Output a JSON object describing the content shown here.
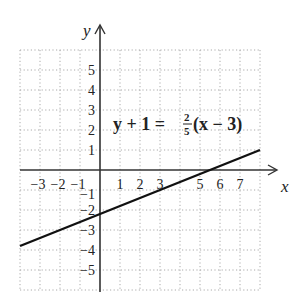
{
  "chart_data": {
    "type": "line",
    "title": "",
    "xlabel": "x",
    "ylabel": "y",
    "xlim": [
      -4,
      8
    ],
    "ylim": [
      -6,
      6
    ],
    "grid": true,
    "grid_style": "dotted",
    "x_ticks": [
      "-3",
      "-2",
      "-1",
      "1",
      "2",
      "3",
      "5",
      "6",
      "7"
    ],
    "y_ticks": [
      "5",
      "4",
      "3",
      "2",
      "1",
      "-1",
      "-2",
      "-3",
      "-4",
      "-5"
    ],
    "annotation": "y + 1 = 2/5(x − 3)",
    "equation": {
      "lhs": "y + 1 =",
      "num": "2",
      "den": "5",
      "rhs": "(x − 3)"
    },
    "series": [
      {
        "name": "y + 1 = 2/5(x − 3)",
        "slope": 0.4,
        "intercept": -2.2,
        "x": [
          -4,
          8
        ],
        "y": [
          -3.8,
          1.0
        ]
      }
    ]
  },
  "labels": {
    "x_axis": "x",
    "y_axis": "y"
  }
}
